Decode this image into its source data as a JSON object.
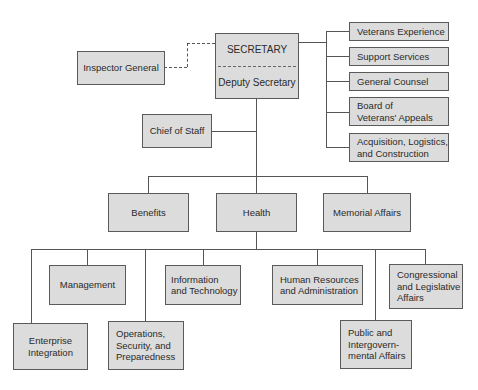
{
  "diagram": {
    "type": "org-chart",
    "top": {
      "secretary": "SECRETARY",
      "deputy": "Deputy Secretary"
    },
    "inspector_general": "Inspector General",
    "chief_of_staff": "Chief of Staff",
    "staff_offices": [
      {
        "label": "Veterans Experience"
      },
      {
        "label": "Support Services"
      },
      {
        "label": "General Counsel"
      },
      {
        "label": "Board of\nVeterans' Appeals"
      },
      {
        "label": "Acquisition, Logistics,\nand Construction"
      }
    ],
    "administrations": [
      {
        "label": "Benefits"
      },
      {
        "label": "Health"
      },
      {
        "label": "Memorial Affairs"
      }
    ],
    "assistant_offices": [
      {
        "label": "Enterprise\nIntegration"
      },
      {
        "label": "Management"
      },
      {
        "label": "Operations,\nSecurity, and\nPreparedness"
      },
      {
        "label": "Information\nand Technology"
      },
      {
        "label": "Human Resources\nand Administration"
      },
      {
        "label": "Public and\nIntergovern-\nmental Affairs"
      },
      {
        "label": "Congressional\nand Legislative\nAffairs"
      }
    ],
    "colors": {
      "box_fill": "#dcdcdc",
      "box_border": "#5a5a5a",
      "line": "#555555",
      "background": "#ffffff"
    }
  }
}
